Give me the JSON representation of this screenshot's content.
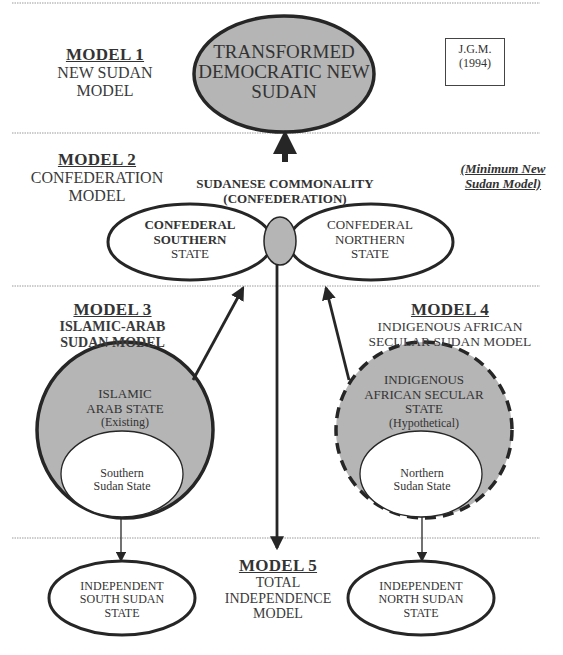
{
  "signature": {
    "author": "J.G.M.",
    "year": "(1994)"
  },
  "annotation": {
    "line1": "(Minimum New",
    "line2": "Sudan Model)"
  },
  "models": [
    {
      "title": "MODEL 1",
      "subtitle_lines": [
        "NEW SUDAN",
        "MODEL"
      ]
    },
    {
      "title": "MODEL 2",
      "subtitle_lines": [
        "CONFEDERATION",
        "MODEL"
      ]
    },
    {
      "title": "MODEL 3",
      "subtitle_lines": [
        "ISLAMIC-ARAB",
        "SUDAN MODEL"
      ]
    },
    {
      "title": "MODEL 4",
      "subtitle_lines": [
        "INDIGENOUS AFRICAN",
        "SECULAR SUDAN MODEL"
      ]
    },
    {
      "title": "MODEL 5",
      "subtitle_lines": [
        "TOTAL",
        "INDEPENDENCE",
        "MODEL"
      ]
    }
  ],
  "nodes": {
    "transformed": {
      "lines": [
        "TRANSFORMED",
        "DEMOCRATIC NEW",
        "SUDAN"
      ]
    },
    "commonality": {
      "lines": [
        "SUDANESE COMMONALITY",
        "(CONFEDERATION)"
      ]
    },
    "confederal_southern": {
      "lines_bold": [
        "CONFEDERAL",
        "SOUTHERN"
      ],
      "line_plain": "STATE"
    },
    "confederal_northern": {
      "lines": [
        "CONFEDERAL",
        "NORTHERN",
        "STATE"
      ]
    },
    "islamic_arab_state": {
      "lines": [
        "ISLAMIC",
        "ARAB STATE"
      ],
      "note": "(Existing)"
    },
    "southern_sudan_state": {
      "lines": [
        "Southern",
        "Sudan State"
      ]
    },
    "indigenous_state": {
      "lines": [
        "INDIGENOUS",
        "AFRICAN SECULAR",
        "STATE"
      ],
      "note": "(Hypothetical)"
    },
    "northern_sudan_state": {
      "lines": [
        "Northern",
        "Sudan State"
      ]
    },
    "independent_south": {
      "lines": [
        "INDEPENDENT",
        "SOUTH SUDAN",
        "STATE"
      ]
    },
    "independent_north": {
      "lines": [
        "INDEPENDENT",
        "NORTH SUDAN",
        "STATE"
      ]
    }
  },
  "colors": {
    "fill_gray": "#b5b5b5",
    "stroke": "#262626",
    "divider": "#9a9a9a"
  }
}
